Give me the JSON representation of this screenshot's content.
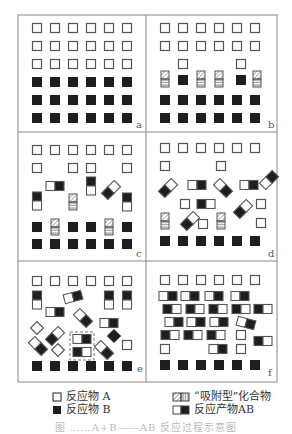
{
  "figure": {
    "panels": [
      {
        "label": "a",
        "description": "reactants A (open squares) above reactants B (filled squares)"
      },
      {
        "label": "b",
        "description": "some A and B pairs form adsorbed-type compounds"
      },
      {
        "label": "c",
        "description": "adsorbed compounds and AB products appear"
      },
      {
        "label": "d",
        "description": "many AB products rotate and move"
      },
      {
        "label": "e",
        "description": "AB products with highlighted pair (dashed box)"
      },
      {
        "label": "f",
        "description": "mostly AB products in rows"
      }
    ],
    "legend": [
      {
        "key": "reactant-a",
        "label": "反应物 A"
      },
      {
        "key": "reactant-b",
        "label": "反应物 B"
      },
      {
        "key": "adsorbed",
        "label": "“吸附型”化合物"
      },
      {
        "key": "product-ab",
        "label": "反应产物AB"
      }
    ],
    "caption": "图 ……A+B——AB 反应过程示意图",
    "colors": {
      "line": "#555555",
      "fill": "#1e1e1e",
      "frame": "#888888"
    }
  }
}
